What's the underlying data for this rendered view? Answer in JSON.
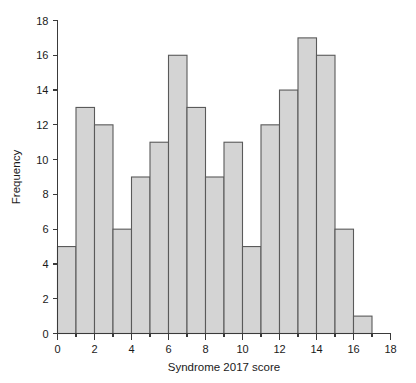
{
  "chart_data": {
    "type": "bar",
    "title": "",
    "subtitle": "",
    "xlabel": "Syndrome 2017 score",
    "ylabel": "Frequency",
    "xlim": [
      0,
      18
    ],
    "ylim": [
      0,
      18
    ],
    "grid": false,
    "legend": null,
    "bin_width": 1,
    "bin_starts": [
      0,
      1,
      2,
      3,
      4,
      5,
      6,
      7,
      8,
      9,
      10,
      11,
      12,
      13,
      14,
      15,
      16
    ],
    "bin_ends": [
      1,
      2,
      3,
      4,
      5,
      6,
      7,
      8,
      9,
      10,
      11,
      12,
      13,
      14,
      15,
      16,
      17
    ],
    "categories": [
      "0-1",
      "1-2",
      "2-3",
      "3-4",
      "4-5",
      "5-6",
      "6-7",
      "7-8",
      "8-9",
      "9-10",
      "10-11",
      "11-12",
      "12-13",
      "13-14",
      "14-15",
      "15-16",
      "16-17"
    ],
    "values": [
      5,
      13,
      12,
      6,
      9,
      11,
      16,
      13,
      9,
      11,
      5,
      12,
      14,
      17,
      16,
      6,
      1
    ],
    "xticks": [
      0,
      2,
      4,
      6,
      8,
      10,
      12,
      14,
      16,
      18
    ],
    "xtick_labels": [
      "0",
      "2",
      "4",
      "6",
      "8",
      "10",
      "12",
      "14",
      "16",
      "18"
    ],
    "xminor_ticks": [
      1,
      3,
      5,
      7,
      9,
      11,
      13,
      15,
      17
    ],
    "yticks": [
      0,
      2,
      4,
      6,
      8,
      10,
      12,
      14,
      16,
      18
    ],
    "ytick_labels": [
      "0",
      "2",
      "4",
      "6",
      "8",
      "10",
      "12",
      "14",
      "16",
      "18"
    ],
    "bar_fill_color": "#d4d4d4",
    "bar_edge_color": "#5a5a5a",
    "axis_color": "#3a3a3a",
    "background_color": "#ffffff",
    "total_count": 176
  }
}
